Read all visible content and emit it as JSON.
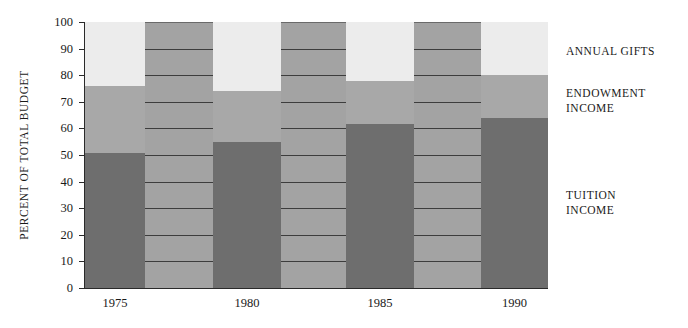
{
  "chart_data": {
    "type": "bar",
    "subtype": "stacked-100-percent",
    "title": "",
    "xlabel": "",
    "ylabel": "PERCENT OF TOTAL BUDGET",
    "ylim": [
      0,
      100
    ],
    "yticks": [
      0,
      10,
      20,
      30,
      40,
      50,
      60,
      70,
      80,
      90,
      100
    ],
    "ytick_labels": [
      "0",
      "10",
      "20",
      "30",
      "40",
      "50",
      "60",
      "70",
      "80",
      "90",
      "100"
    ],
    "grid": true,
    "grid_axis": "y",
    "legend_position": "right",
    "categories": [
      "1975",
      "",
      "1980",
      "",
      "1985",
      "",
      "1990"
    ],
    "xtick_labels": [
      "1975",
      "1980",
      "1985",
      "1990"
    ],
    "xtick_categories": [
      0,
      2,
      4,
      6
    ],
    "series": [
      {
        "name": "TUITION INCOME",
        "color": "#6e6e6e",
        "values": [
          51,
          null,
          55,
          null,
          62,
          null,
          64
        ]
      },
      {
        "name": "ENDOWMENT INCOME",
        "color": "#a8a8a8",
        "values": [
          25,
          null,
          19,
          null,
          16,
          null,
          16
        ]
      },
      {
        "name": "ANNUAL GIFTS",
        "color": "#ececec",
        "values": [
          24,
          null,
          26,
          null,
          22,
          null,
          20
        ]
      }
    ],
    "cumulative_tops": {
      "tuition": [
        51,
        null,
        55,
        null,
        62,
        null,
        64
      ],
      "endowment": [
        76,
        null,
        74,
        null,
        78,
        null,
        80
      ],
      "annual_gifts": [
        100,
        null,
        100,
        null,
        100,
        null,
        100
      ]
    },
    "bars": [
      {
        "label": "1975",
        "labelled": true,
        "x": 0,
        "width": 60,
        "tuition": 51,
        "endowment_top": 76,
        "gifts_top": 100
      },
      {
        "label": "",
        "labelled": false,
        "x": 60,
        "width": 68,
        "tuition": null,
        "endowment_top": null,
        "gifts_top": null
      },
      {
        "label": "1980",
        "labelled": true,
        "x": 128,
        "width": 68,
        "tuition": 55,
        "endowment_top": 74,
        "gifts_top": 100
      },
      {
        "label": "",
        "labelled": false,
        "x": 196,
        "width": 65,
        "tuition": null,
        "endowment_top": null,
        "gifts_top": null
      },
      {
        "label": "1985",
        "labelled": true,
        "x": 261,
        "width": 68,
        "tuition": 62,
        "endowment_top": 78,
        "gifts_top": 100
      },
      {
        "label": "",
        "labelled": false,
        "x": 329,
        "width": 67,
        "tuition": null,
        "endowment_top": null,
        "gifts_top": null
      },
      {
        "label": "1990",
        "labelled": true,
        "x": 396,
        "width": 67,
        "tuition": 64,
        "endowment_top": 80,
        "gifts_top": 100
      }
    ],
    "background_color": "#a3a3a3",
    "gridline_color": "#3d3d3d",
    "page_background": "#ffffff"
  },
  "legend": {
    "items": [
      {
        "label": "ANNUAL GIFTS",
        "top": 44,
        "color": "#ececec"
      },
      {
        "label": "ENDOWMENT\nINCOME",
        "top": 86,
        "color": "#a8a8a8"
      },
      {
        "label": "TUITION\nINCOME",
        "top": 188,
        "color": "#6e6e6e"
      }
    ]
  }
}
